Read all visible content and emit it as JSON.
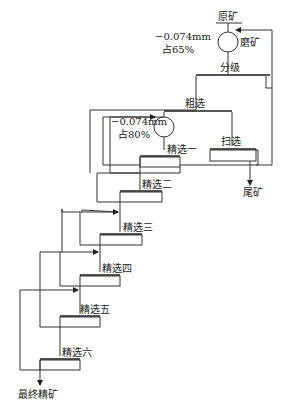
{
  "diagram": {
    "type": "flowsheet",
    "feed": "原矿",
    "grinding": "磨矿",
    "grind_size_1": "−0.074mm",
    "grind_pct_1": "占65%",
    "classification": "分级",
    "rougher": "粗选",
    "regrind_size": "−0.074mm",
    "regrind_pct": "占80%",
    "scavenger": "扫选",
    "tailings": "尾矿",
    "cleaners": [
      "精选一",
      "精选二",
      "精选三",
      "精选四",
      "精选五",
      "精选六"
    ],
    "final_concentrate": "最终精矿"
  }
}
